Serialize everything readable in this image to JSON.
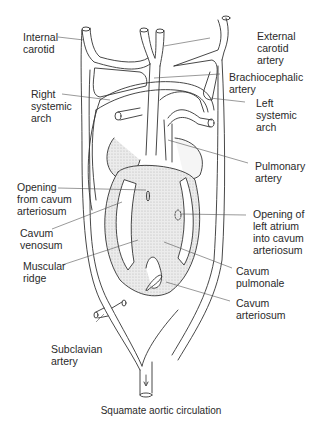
{
  "diagram": {
    "caption": "Squamate aortic circulation",
    "labels": {
      "internal_carotid": "Internal\ncarotid",
      "external_carotid": "External\ncarotid\nartery",
      "brachiocephalic": "Brachiocephalic\nartery",
      "right_systemic": "Right\nsystemic\narch",
      "left_systemic": "Left\nsystemic\narch",
      "pulmonary_artery": "Pulmonary\nartery",
      "opening_cavum": "Opening\nfrom cavum\narteriosum",
      "cavum_venosum": "Cavum\nvenosum",
      "opening_left_atrium": "Opening of\nleft atrium\ninto cavum\narteriosum",
      "muscular_ridge": "Muscular\nridge",
      "cavum_pulmonale": "Cavum\npulmonale",
      "cavum_arteriosum": "Cavum\narteriosum",
      "subclavian": "Subclavian\nartery"
    },
    "colors": {
      "line": "#333333",
      "shade": "#d8d8d8",
      "background": "#ffffff"
    }
  }
}
